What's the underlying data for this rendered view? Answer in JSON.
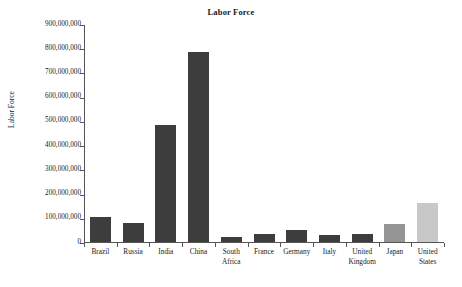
{
  "chart_data": {
    "type": "bar",
    "title": "Labor Force",
    "xlabel": "",
    "ylabel": "Labor Force",
    "categories": [
      "Brazil",
      "Russia",
      "India",
      "China",
      "South\nAfrica",
      "France",
      "Germany",
      "Italy",
      "United\nKingdom",
      "Japan",
      "United\nStates"
    ],
    "values": [
      103000000,
      78000000,
      483000000,
      783000000,
      21000000,
      33000000,
      49000000,
      31000000,
      35000000,
      73000000,
      162000000
    ],
    "bar_colors": [
      "#3d3d3d",
      "#3d3d3d",
      "#3d3d3d",
      "#3d3d3d",
      "#3d3d3d",
      "#3d3d3d",
      "#3d3d3d",
      "#3d3d3d",
      "#3d3d3d",
      "#949494",
      "#c8c8c8"
    ],
    "ylim": [
      0,
      900000000
    ],
    "ytick_values": [
      0,
      100000000,
      200000000,
      300000000,
      400000000,
      500000000,
      600000000,
      700000000,
      800000000,
      900000000
    ],
    "ytick_labels": [
      "0",
      "100,000,000",
      "200,000,000",
      "300,000,000",
      "400,000,000",
      "500,000,000",
      "600,000,000",
      "700,000,000",
      "800,000,000",
      "900,000,000"
    ],
    "grid": false,
    "legend": "none"
  },
  "figure": {
    "background_color": "#ffffff",
    "axis_color": "#555555"
  }
}
